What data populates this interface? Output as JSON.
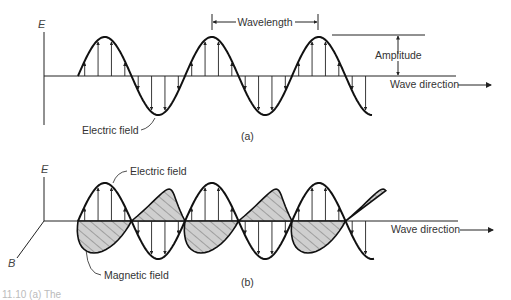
{
  "figure": {
    "panel_a": {
      "axis_label": "E",
      "wavelength_label": "Wavelength",
      "amplitude_label": "Amplitude",
      "direction_label": "Wave direction",
      "field_label": "Electric field",
      "panel_tag": "(a)"
    },
    "panel_b": {
      "axis_label_vertical": "E",
      "axis_label_depth": "B",
      "electric_label": "Electric field",
      "magnetic_label": "Magnetic field",
      "direction_label": "Wave direction",
      "panel_tag": "(b)"
    },
    "caption_fragment": "11.10 (a) The",
    "colors": {
      "line": "#1a1a1a",
      "hatch_fill": "#c8c8c8",
      "text": "#333333"
    }
  }
}
